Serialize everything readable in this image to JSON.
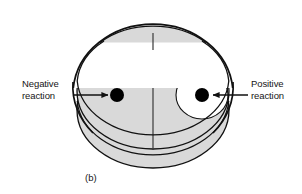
{
  "figure": {
    "caption": "(b)",
    "labels": {
      "negative": {
        "line1": "Negative",
        "line2": "reaction"
      },
      "positive": {
        "line1": "Positive",
        "line2": "reaction"
      }
    }
  },
  "colors": {
    "agar_fill": "#d9d9d9",
    "dish_body_fill": "#d9d9d9",
    "lid_fill": "#ffffff",
    "inhibition_zone_fill": "#ffffff",
    "disk_fill": "#000000",
    "outline": "#111111",
    "text": "#161616",
    "background": "#ffffff"
  },
  "geometry": {
    "lid_ellipse": {
      "cx": 153,
      "cy": 82,
      "rx": 80,
      "ry": 70
    },
    "agar_ellipse": {
      "cx": 153,
      "cy": 91,
      "rx": 76,
      "ry": 58
    },
    "dish_body_bottom": {
      "cx": 153,
      "cy": 110,
      "rx": 76,
      "ry": 58
    },
    "divider_line": {
      "x": 153,
      "y1": 33,
      "y2": 150
    },
    "negative_disk": {
      "cx": 117,
      "cy": 95,
      "r": 7
    },
    "positive_disk": {
      "cx": 202,
      "cy": 95,
      "r": 7
    },
    "inhibition_zone": {
      "cx": 202,
      "cy": 95,
      "rx": 26,
      "ry": 24
    },
    "negative_arrow": {
      "x1": 73,
      "x2": 110,
      "y": 95,
      "direction": "right"
    },
    "positive_arrow": {
      "x1": 248,
      "x2": 211,
      "y": 95,
      "direction": "left"
    }
  }
}
